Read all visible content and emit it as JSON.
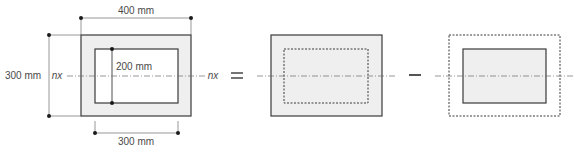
{
  "diagram": {
    "type": "section-subtraction",
    "colors": {
      "fill": "#efefef",
      "stroke": "#3a3a3a",
      "line": "#6a6a6a",
      "text": "#4a4a4a"
    },
    "section": {
      "dim_top": "400 mm",
      "dim_left": "300 mm",
      "dim_inner": "200 mm",
      "dim_bottom": "300 mm",
      "axis_left": "nx",
      "axis_right": "nx"
    },
    "operators": {
      "equals": "=",
      "minus": "−"
    },
    "parts": [
      {
        "name": "outer-solid-rectangle",
        "description": "full 400x300 rectangle with dashed inner outline"
      },
      {
        "name": "inner-solid-rectangle",
        "description": "300x200 rectangle with dashed outer outline"
      }
    ]
  }
}
